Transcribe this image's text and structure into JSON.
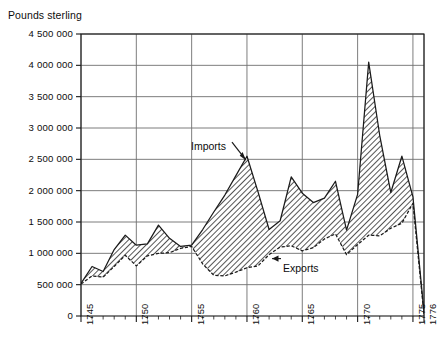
{
  "chart_data": {
    "type": "area",
    "title": "",
    "ylabel": "Pounds sterling",
    "xlabel": "",
    "ylim": [
      0,
      4500000
    ],
    "xlim": [
      1745,
      1776
    ],
    "grid": true,
    "legend_position": "inline-annotations",
    "y_ticks": [
      0,
      500000,
      1000000,
      1500000,
      2000000,
      2500000,
      3000000,
      3500000,
      4000000,
      4500000
    ],
    "y_tick_labels": [
      "0",
      "500 000",
      "1 000 000",
      "1 500 000",
      "2 000 000",
      "2 500 000",
      "3 000 000",
      "3 500 000",
      "4 000 000",
      "4 500 000"
    ],
    "x_ticks": [
      1745,
      1750,
      1755,
      1760,
      1765,
      1770,
      1775,
      1776
    ],
    "x_tick_labels": [
      "1745",
      "1750",
      "1755",
      "1760",
      "1765",
      "1770",
      "1775",
      "1776"
    ],
    "x_minor_tick_interval": 1,
    "x": [
      1745,
      1746,
      1747,
      1748,
      1749,
      1750,
      1751,
      1752,
      1753,
      1754,
      1755,
      1756,
      1757,
      1758,
      1759,
      1760,
      1761,
      1762,
      1763,
      1764,
      1765,
      1766,
      1767,
      1768,
      1769,
      1770,
      1771,
      1772,
      1773,
      1774,
      1775,
      1776
    ],
    "series": [
      {
        "name": "Imports",
        "label": "Imports",
        "line_style": "solid",
        "values": [
          520000,
          790000,
          710000,
          1060000,
          1290000,
          1130000,
          1150000,
          1450000,
          1240000,
          1110000,
          1130000,
          1380000,
          1660000,
          1930000,
          2240000,
          2550000,
          1980000,
          1380000,
          1520000,
          2220000,
          1960000,
          1810000,
          1880000,
          2150000,
          1370000,
          1940000,
          4050000,
          2880000,
          1970000,
          2550000,
          1900000,
          60000
        ]
      },
      {
        "name": "Exports",
        "label": "Exports",
        "line_style": "dashed",
        "values": [
          510000,
          640000,
          620000,
          790000,
          970000,
          800000,
          960000,
          1000000,
          1010000,
          1080000,
          1110000,
          830000,
          650000,
          640000,
          700000,
          770000,
          800000,
          980000,
          1100000,
          1120000,
          1040000,
          1090000,
          1230000,
          1310000,
          980000,
          1140000,
          1290000,
          1280000,
          1400000,
          1480000,
          1800000,
          20000
        ]
      }
    ],
    "fill": {
      "between": [
        "Imports",
        "Exports"
      ],
      "pattern": "diagonal-hatch"
    },
    "annotations": [
      {
        "text": "Imports",
        "points_to_series": "Imports",
        "points_to_x": 1760,
        "arrow": "down-right"
      },
      {
        "text": "Exports",
        "points_to_series": "Exports",
        "points_to_x": 1762,
        "arrow": "left"
      }
    ]
  },
  "colors": {
    "axis": "#1a1a1a",
    "grid": "#6e6e6e",
    "hatch": "#2b2b2b",
    "background": "#ffffff",
    "text": "#0d0d0d"
  }
}
